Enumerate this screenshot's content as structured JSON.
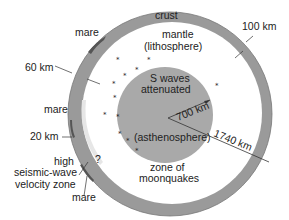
{
  "diagram": {
    "colors": {
      "crust": "#9a9a9a",
      "mantle": "#ffffff",
      "core": "#a9a9a9",
      "text": "#222222",
      "mare": "#555555"
    },
    "regions": {
      "crust": "crust",
      "mantle": "mantle",
      "lithosphere": "(lithosphere)",
      "core_line1": "S waves",
      "core_line2": "attenuated",
      "asthenosphere": "(asthenosphere)",
      "moonquakes_line1": "zone of",
      "moonquakes_line2": "moonquakes"
    },
    "measurements": {
      "crust_right": "100 km",
      "crust_left": "60 km",
      "crust_lower_left": "20 km",
      "core_radius": "700 km",
      "moon_radius": "1740 km"
    },
    "annotations": {
      "mare_top": "mare",
      "mare_mid": "mare",
      "mare_bottom": "mare",
      "high_line1": "high",
      "high_line2": "seismic-wave",
      "high_line3": "velocity zone",
      "question": "?"
    }
  }
}
